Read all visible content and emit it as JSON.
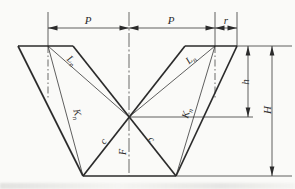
{
  "figure": {
    "type": "v-die-engineering-dimension-diagram",
    "background": "#fafaf8",
    "line_color": "#2b2b2b"
  },
  "dimensions": {
    "pitch_left": "P",
    "pitch_right": "P",
    "radius": "r",
    "crossing_depth": "h",
    "total_height": "H"
  },
  "edge_labels": {
    "L_left": {
      "base": "L",
      "sub": "n"
    },
    "L_right": {
      "base": "L",
      "sub": "n"
    },
    "K_left": {
      "base": "K",
      "sub": "n"
    },
    "K_right": {
      "base": "K",
      "sub": "n"
    },
    "c_left": "c",
    "c_right": "c",
    "force": "F"
  }
}
